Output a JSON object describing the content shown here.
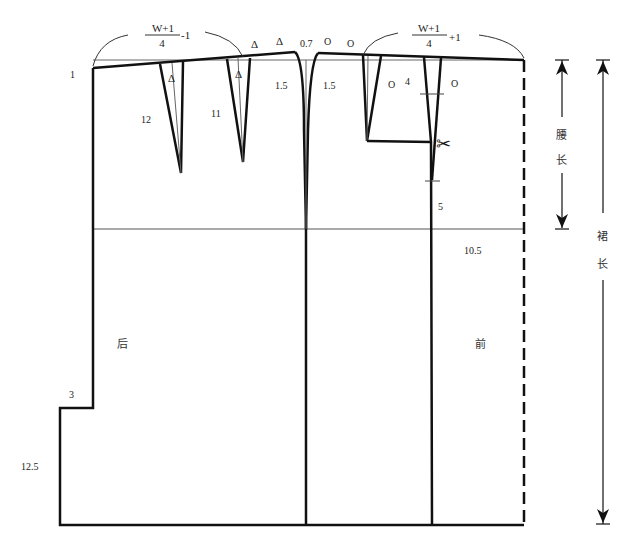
{
  "diagram": {
    "type": "skirt-pattern-draft",
    "colors": {
      "line": "#111111",
      "thin": "#555555",
      "background": "#ffffff"
    },
    "labels": {
      "back_waist_formula_num": "W+1",
      "back_waist_formula_den": "4",
      "back_waist_formula_adj": "-1",
      "front_waist_formula_num": "W+1",
      "front_waist_formula_den": "4",
      "front_waist_formula_adj": "+1",
      "waist_rise_left": "1",
      "back_dart1_length": "12",
      "back_dart2_length": "11",
      "back_dart1_mark": "Δ",
      "back_dart2_mark": "Δ",
      "waist_mark_delta1": "Δ",
      "waist_mark_delta2": "Δ",
      "side_raise": "0.7",
      "side_curve_back": "1.5",
      "side_curve_front": "1.5",
      "front_mark_o1": "O",
      "front_mark_o2": "O",
      "front_dart1_mark": "O",
      "front_dart2_mark": "O",
      "front_pocket_offset": "4",
      "front_seam_5": "5",
      "front_hip_10_5": "10.5",
      "back_label": "后",
      "front_label": "前",
      "vent_width": "3",
      "vent_length": "12.5",
      "waist_length_char1": "腰",
      "waist_length_char2": "长",
      "skirt_length_char1": "裙",
      "skirt_length_char2": "长",
      "scissors": "✂"
    }
  }
}
